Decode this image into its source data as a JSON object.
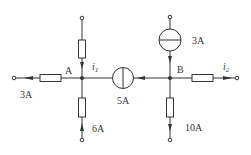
{
  "diagram": {
    "type": "circuit",
    "nodes": {
      "A": {
        "label": "A"
      },
      "B": {
        "label": "B"
      }
    },
    "labels": {
      "left_current": "3A",
      "i1_main": "i",
      "i1_sub": "1",
      "source_middle": "5A",
      "bottom_A_current": "6A",
      "top_B_source": "3A",
      "i2_main": "i",
      "i2_sub": "2",
      "bottom_B_current": "10A"
    },
    "colors": {
      "line": "#333333",
      "background": "#ffffff"
    }
  }
}
